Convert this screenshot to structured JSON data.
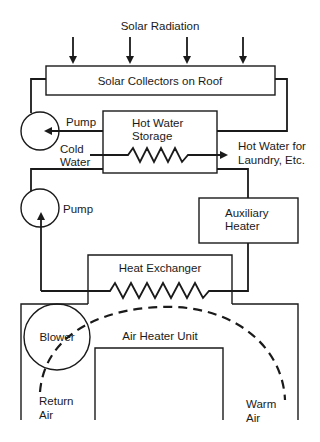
{
  "diagram": {
    "type": "solar heating system schematic",
    "labels": {
      "solar_radiation": "Solar Radiation",
      "solar_collectors": "Solar Collectors on Roof",
      "pump_top": "Pump",
      "hot_water_storage_line1": "Hot Water",
      "hot_water_storage_line2": "Storage",
      "cold_water_line1": "Cold",
      "cold_water_line2": "Water",
      "hot_water_out_line1": "Hot Water for",
      "hot_water_out_line2": "Laundry, Etc.",
      "pump_middle": "Pump",
      "auxiliary_heater_line1": "Auxiliary",
      "auxiliary_heater_line2": "Heater",
      "heat_exchanger": "Heat Exchanger",
      "blower": "Blower",
      "air_heater_unit": "Air Heater Unit",
      "return_air_line1": "Return",
      "return_air_line2": "Air",
      "warm_air_line1": "Warm",
      "warm_air_line2": "Air"
    },
    "nodes": [
      {
        "id": "solar-collectors",
        "label": "Solar Collectors on Roof"
      },
      {
        "id": "pump-top",
        "label": "Pump"
      },
      {
        "id": "hot-water-storage",
        "label": "Hot Water Storage"
      },
      {
        "id": "pump-middle",
        "label": "Pump"
      },
      {
        "id": "auxiliary-heater",
        "label": "Auxiliary Heater"
      },
      {
        "id": "heat-exchanger",
        "label": "Heat Exchanger"
      },
      {
        "id": "blower",
        "label": "Blower"
      },
      {
        "id": "air-heater-unit",
        "label": "Air Heater Unit"
      }
    ],
    "edges": [
      {
        "from": "solar-radiation",
        "to": "solar-collectors"
      },
      {
        "from": "solar-collectors",
        "to": "pump-top"
      },
      {
        "from": "hot-water-storage",
        "to": "pump-top"
      },
      {
        "from": "solar-collectors",
        "to": "hot-water-storage"
      },
      {
        "from": "cold-water",
        "to": "hot-water-out",
        "via": "hot-water-storage coil"
      },
      {
        "from": "hot-water-storage",
        "to": "pump-middle"
      },
      {
        "from": "hot-water-storage",
        "to": "auxiliary-heater"
      },
      {
        "from": "auxiliary-heater",
        "to": "heat-exchanger"
      },
      {
        "from": "heat-exchanger",
        "to": "pump-middle"
      },
      {
        "from": "blower",
        "to": "warm-air",
        "style": "dashed airflow"
      }
    ],
    "colors": {
      "ink": "#1a1a1a",
      "background": "#ffffff"
    }
  }
}
